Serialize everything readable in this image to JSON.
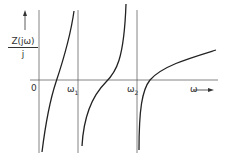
{
  "figure": {
    "y_label_numerator": "Z(jω)",
    "y_label_denominator": "j",
    "origin_label": "0",
    "x_label": "ω",
    "pole_labels": [
      {
        "symbol": "ω",
        "sub": "1"
      },
      {
        "symbol": "ω",
        "sub": "2"
      }
    ],
    "colors": {
      "line": "#222222",
      "axis": "#555555",
      "background": "#ffffff"
    }
  }
}
